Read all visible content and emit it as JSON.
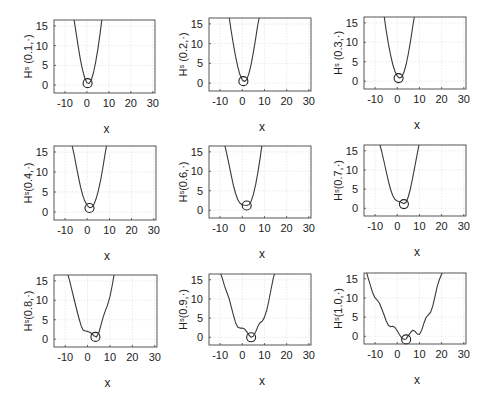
{
  "chart_data": [
    {
      "type": "line",
      "ylabel": "Hˢ (0.1,·)",
      "xlabel": "x",
      "xlim": [
        -15,
        31
      ],
      "ylim": [
        -2,
        16.5
      ],
      "xticks": [
        -10,
        0,
        10,
        20,
        30
      ],
      "yticks": [
        0,
        5,
        10,
        15
      ],
      "grid": true,
      "x": [
        -6,
        -5,
        -4,
        -3,
        -2,
        -1,
        0,
        1,
        2,
        3,
        4,
        5,
        6,
        7
      ],
      "y": [
        17,
        13.4,
        9.8,
        6.6,
        3.9,
        1.8,
        0.6,
        0.4,
        1.3,
        3.2,
        5.9,
        9.2,
        13.1,
        17.5
      ],
      "marker": {
        "x": 0.3,
        "y": 0.5
      }
    },
    {
      "type": "line",
      "ylabel": "Hˢ (0.2,·)",
      "xlabel": "x",
      "xlim": [
        -15,
        31
      ],
      "ylim": [
        -2,
        16.5
      ],
      "xticks": [
        -10,
        0,
        10,
        20,
        30
      ],
      "yticks": [
        0,
        5,
        10,
        15
      ],
      "grid": true,
      "x": [
        -6,
        -5,
        -4,
        -3,
        -2,
        -1,
        0,
        1,
        2,
        3,
        4,
        5,
        6,
        7,
        8
      ],
      "y": [
        17,
        13.2,
        9.8,
        6.7,
        4.1,
        2.1,
        0.8,
        0.4,
        0.9,
        2.4,
        4.7,
        7.7,
        11.2,
        14.8,
        17.5
      ],
      "marker": {
        "x": 0.5,
        "y": 0.5
      }
    },
    {
      "type": "line",
      "ylabel": "Hˢ (0.3,·)",
      "xlabel": "x",
      "xlim": [
        -15,
        31
      ],
      "ylim": [
        -2,
        16.5
      ],
      "xticks": [
        -10,
        0,
        10,
        20,
        30
      ],
      "yticks": [
        0,
        5,
        10,
        15
      ],
      "grid": true,
      "x": [
        -6,
        -5,
        -4,
        -3,
        -2,
        -1,
        0,
        1,
        2,
        3,
        4,
        5,
        6,
        7,
        8
      ],
      "y": [
        17,
        13.0,
        9.6,
        6.7,
        4.3,
        2.5,
        1.3,
        0.8,
        1.1,
        2.3,
        4.3,
        7.0,
        10.4,
        14.2,
        17.5
      ],
      "marker": {
        "x": 0.6,
        "y": 0.8
      }
    },
    {
      "type": "line",
      "ylabel": "Hˢ(0.4,·)",
      "xlabel": "x",
      "xlim": [
        -15,
        31
      ],
      "ylim": [
        -2,
        16.5
      ],
      "xticks": [
        -10,
        0,
        10,
        20,
        30
      ],
      "yticks": [
        0,
        5,
        10,
        15
      ],
      "grid": true,
      "x": [
        -7,
        -6,
        -5,
        -4,
        -3,
        -2,
        -1,
        0,
        1,
        2,
        3,
        4,
        5,
        6,
        7,
        8,
        9
      ],
      "y": [
        17,
        14.5,
        11.6,
        8.8,
        6.2,
        4.1,
        2.6,
        1.6,
        1.1,
        1.2,
        1.9,
        3.3,
        5.3,
        7.9,
        11.0,
        14.4,
        17.5
      ],
      "marker": {
        "x": 1.0,
        "y": 1.0
      }
    },
    {
      "type": "line",
      "ylabel": "Hˢ(0.6,·)",
      "xlabel": "x",
      "xlim": [
        -15,
        31
      ],
      "ylim": [
        -2,
        16.5
      ],
      "xticks": [
        -10,
        0,
        10,
        20,
        30
      ],
      "yticks": [
        0,
        5,
        10,
        15
      ],
      "grid": true,
      "x": [
        -8,
        -7,
        -6,
        -5,
        -4,
        -3,
        -2,
        -1,
        0,
        1,
        2,
        3,
        4,
        5,
        6,
        7,
        8,
        9
      ],
      "y": [
        17,
        14.6,
        11.8,
        9.0,
        6.4,
        4.3,
        2.7,
        1.8,
        1.4,
        1.3,
        1.2,
        1.4,
        2.3,
        4.0,
        6.5,
        9.6,
        13.2,
        17.2
      ],
      "marker": {
        "x": 2.0,
        "y": 1.2
      }
    },
    {
      "type": "line",
      "ylabel": "Hˢ(0.7,·)",
      "xlabel": "x",
      "xlim": [
        -15,
        31
      ],
      "ylim": [
        -2,
        16.5
      ],
      "xticks": [
        -10,
        0,
        10,
        20,
        30
      ],
      "yticks": [
        0,
        5,
        10,
        15
      ],
      "grid": true,
      "x": [
        -8,
        -7,
        -6,
        -5,
        -4,
        -3,
        -2,
        -1,
        0,
        1,
        2,
        3,
        4,
        5,
        6,
        7,
        8,
        9,
        10
      ],
      "y": [
        17,
        14.8,
        12.2,
        9.6,
        7.1,
        4.9,
        3.3,
        2.3,
        1.9,
        1.7,
        1.5,
        1.2,
        1.6,
        3.0,
        5.3,
        8.1,
        11.1,
        14.1,
        17.2
      ],
      "marker": {
        "x": 3.0,
        "y": 1.1
      }
    },
    {
      "type": "line",
      "ylabel": "Hˢ(0.8,·)",
      "xlabel": "x",
      "xlim": [
        -15,
        31
      ],
      "ylim": [
        -2,
        16.5
      ],
      "xticks": [
        -10,
        0,
        10,
        20,
        30
      ],
      "yticks": [
        0,
        5,
        10,
        15
      ],
      "grid": true,
      "x": [
        -9,
        -8,
        -7,
        -6,
        -5,
        -4,
        -3,
        -2,
        -1,
        0,
        1,
        2,
        3,
        4,
        5,
        6,
        7,
        8,
        9,
        10,
        11,
        12
      ],
      "y": [
        17,
        15.0,
        12.6,
        10.2,
        7.9,
        5.7,
        3.6,
        2.4,
        2.1,
        2.0,
        1.8,
        1.4,
        0.8,
        0.6,
        1.6,
        3.7,
        5.8,
        7.4,
        8.9,
        11.0,
        13.8,
        17.2
      ],
      "marker": {
        "x": 3.5,
        "y": 0.6
      }
    },
    {
      "type": "line",
      "ylabel": "Hˢ(0.9,·)",
      "xlabel": "x",
      "xlim": [
        -15,
        31
      ],
      "ylim": [
        -2,
        16.5
      ],
      "xticks": [
        -10,
        0,
        10,
        20,
        30
      ],
      "yticks": [
        0,
        5,
        10,
        15
      ],
      "grid": true,
      "x": [
        -10,
        -9,
        -8,
        -7,
        -6,
        -5,
        -4,
        -3,
        -2,
        -1,
        0,
        1,
        2,
        3,
        4,
        5,
        6,
        7,
        8,
        9,
        10,
        11,
        12,
        13,
        14,
        15
      ],
      "y": [
        17,
        15.4,
        13.4,
        11.8,
        10.2,
        8.0,
        5.8,
        3.8,
        2.6,
        2.4,
        2.4,
        2.2,
        1.5,
        0.6,
        0.0,
        0.3,
        1.4,
        2.8,
        3.8,
        4.2,
        5.2,
        7.0,
        9.6,
        12.6,
        15.4,
        17.5
      ],
      "marker": {
        "x": 4.0,
        "y": 0.0
      }
    },
    {
      "type": "line",
      "ylabel": "Hˢ(1.0,·)",
      "xlabel": "x",
      "xlim": [
        -15,
        31
      ],
      "ylim": [
        -2,
        16.5
      ],
      "xticks": [
        -10,
        0,
        10,
        20,
        30
      ],
      "yticks": [
        0,
        5,
        10,
        15
      ],
      "grid": true,
      "x": [
        -14,
        -13,
        -12,
        -11,
        -10,
        -9,
        -8,
        -7,
        -6,
        -5,
        -4,
        -3,
        -2,
        -1,
        0,
        1,
        2,
        3,
        4,
        5,
        6,
        7,
        8,
        9,
        10,
        11,
        12,
        13,
        14,
        15,
        16,
        17,
        18,
        19,
        20,
        21
      ],
      "y": [
        17,
        15.0,
        13.0,
        11.2,
        10.0,
        9.4,
        8.6,
        7.2,
        5.6,
        4.0,
        2.9,
        2.5,
        2.6,
        2.3,
        1.4,
        0.4,
        -0.4,
        -0.8,
        -0.7,
        0.2,
        1.0,
        1.6,
        1.3,
        0.6,
        0.5,
        1.6,
        3.4,
        4.9,
        5.6,
        6.2,
        7.8,
        10.4,
        13.0,
        14.8,
        16.2,
        17.2
      ],
      "marker": {
        "x": 4.0,
        "y": -0.8
      }
    }
  ]
}
